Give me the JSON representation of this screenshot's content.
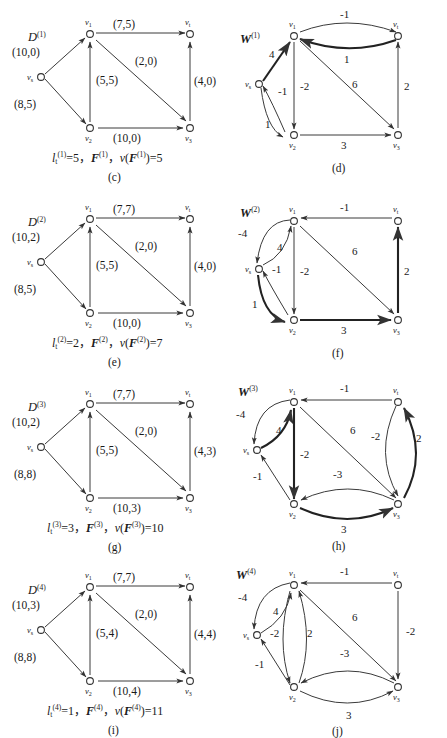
{
  "sheet": {
    "title": "Network flow iteration figures",
    "background": "#ffffff",
    "ink": "#1a1a1a",
    "accent_heavy": "#222222"
  },
  "vertex_names": {
    "s": "v",
    "s_sub": "s",
    "v1": "v",
    "v1_sub": "1",
    "v2": "v",
    "v2_sub": "2",
    "v3": "v",
    "v3_sub": "3",
    "t": "v",
    "t_sub": "t"
  },
  "rows": [
    {
      "id": "row-1",
      "flow_panel": {
        "graph_label_base": "D",
        "graph_label_sup": "(1)",
        "subcaption": "(c)",
        "caption_parts": {
          "l_base": "l",
          "l_sub": "t",
          "l_sup": "(1)",
          "l_value": "=5",
          "sep1": "，",
          "F_base": "F",
          "F_sup": "(1)",
          "sep2": "，",
          "v_base": "v(F",
          "v_sup": "(1)",
          "v_close": ")",
          "v_value": "=11"
        },
        "caption_text": "l t (1) =5， F (1) ， v(F (1) )=5",
        "edges": [
          {
            "name": "s-v1",
            "label": "(10,0)"
          },
          {
            "name": "s-v2",
            "label": "(8,5)"
          },
          {
            "name": "v1-t",
            "label": "(7,5)"
          },
          {
            "name": "v2-v1",
            "label": "(5,5)"
          },
          {
            "name": "v1-v3",
            "label": "(2,0)"
          },
          {
            "name": "v2-v3",
            "label": "(10,0)"
          },
          {
            "name": "v3-t",
            "label": "(4,0)"
          }
        ]
      },
      "residual_panel": {
        "graph_label_base": "W",
        "graph_label_sup": "(1)",
        "subcaption": "(d)",
        "edges": [
          {
            "name": "s-v1",
            "label": "4",
            "heavy": true
          },
          {
            "name": "s-v2",
            "label": "1",
            "heavy": false
          },
          {
            "name": "v2-s",
            "label": "-1",
            "heavy": false
          },
          {
            "name": "v1-t",
            "label": "-1",
            "heavy": false
          },
          {
            "name": "t-v1",
            "label": "1",
            "heavy": true
          },
          {
            "name": "v1-v2",
            "label": "-2",
            "heavy": false
          },
          {
            "name": "v1-v3",
            "label": "6",
            "heavy": false
          },
          {
            "name": "v2-v3",
            "label": "3",
            "heavy": false
          },
          {
            "name": "v3-t",
            "label": "2",
            "heavy": false
          }
        ]
      }
    },
    {
      "id": "row-2",
      "flow_panel": {
        "graph_label_base": "D",
        "graph_label_sup": "(2)",
        "subcaption": "(e)",
        "caption_text": "l t (2) =2， F (2) ， v(F (2) )=7",
        "edges": [
          {
            "name": "s-v1",
            "label": "(10,2)"
          },
          {
            "name": "s-v2",
            "label": "(8,5)"
          },
          {
            "name": "v1-t",
            "label": "(7,7)"
          },
          {
            "name": "v2-v1",
            "label": "(5,5)"
          },
          {
            "name": "v1-v3",
            "label": "(2,0)"
          },
          {
            "name": "v2-v3",
            "label": "(10,0)"
          },
          {
            "name": "v3-t",
            "label": "(4,0)"
          }
        ]
      },
      "residual_panel": {
        "graph_label_base": "W",
        "graph_label_sup": "(2)",
        "subcaption": "(f)",
        "edges": [
          {
            "name": "v1-s",
            "label": "-4",
            "heavy": false
          },
          {
            "name": "s-v1",
            "label": "4",
            "heavy": false
          },
          {
            "name": "v2-s",
            "label": "-1",
            "heavy": false
          },
          {
            "name": "s-v2",
            "label": "1",
            "heavy": true
          },
          {
            "name": "t-v1",
            "label": "-1",
            "heavy": false
          },
          {
            "name": "v1-v2",
            "label": "-2",
            "heavy": false
          },
          {
            "name": "v1-v3",
            "label": "6",
            "heavy": false
          },
          {
            "name": "v2-v3",
            "label": "3",
            "heavy": true
          },
          {
            "name": "v3-t",
            "label": "2",
            "heavy": true
          }
        ]
      }
    },
    {
      "id": "row-3",
      "flow_panel": {
        "graph_label_base": "D",
        "graph_label_sup": "(3)",
        "subcaption": "(g)",
        "caption_text": "l t (3) =3， F (3) ， v(F (3) )=10",
        "edges": [
          {
            "name": "s-v1",
            "label": "(10,2)"
          },
          {
            "name": "s-v2",
            "label": "(8,8)"
          },
          {
            "name": "v1-t",
            "label": "(7,7)"
          },
          {
            "name": "v2-v1",
            "label": "(5,5)"
          },
          {
            "name": "v1-v3",
            "label": "(2,0)"
          },
          {
            "name": "v2-v3",
            "label": "(10,3)"
          },
          {
            "name": "v3-t",
            "label": "(4,3)"
          }
        ]
      },
      "residual_panel": {
        "graph_label_base": "W",
        "graph_label_sup": "(3)",
        "subcaption": "(h)",
        "edges": [
          {
            "name": "v1-s",
            "label": "-4",
            "heavy": false
          },
          {
            "name": "s-v1",
            "label": "4",
            "heavy": true
          },
          {
            "name": "v2-s",
            "label": "-1",
            "heavy": false
          },
          {
            "name": "t-v1",
            "label": "-1",
            "heavy": false
          },
          {
            "name": "v1-v2",
            "label": "-2",
            "heavy": true
          },
          {
            "name": "v1-v3",
            "label": "6",
            "heavy": false
          },
          {
            "name": "t-v3",
            "label": "-2",
            "heavy": false
          },
          {
            "name": "v3-t",
            "label": "2",
            "heavy": true
          },
          {
            "name": "v3-v2",
            "label": "-3",
            "heavy": false
          },
          {
            "name": "v2-v3",
            "label": "3",
            "heavy": true
          }
        ]
      }
    },
    {
      "id": "row-4",
      "flow_panel": {
        "graph_label_base": "D",
        "graph_label_sup": "(4)",
        "subcaption": "(i)",
        "caption_text": "l t (4) =1， F (4) ， v(F (4) )=11",
        "edges": [
          {
            "name": "s-v1",
            "label": "(10,3)"
          },
          {
            "name": "s-v2",
            "label": "(8,8)"
          },
          {
            "name": "v1-t",
            "label": "(7,7)"
          },
          {
            "name": "v2-v1",
            "label": "(5,4)"
          },
          {
            "name": "v1-v3",
            "label": "(2,0)"
          },
          {
            "name": "v2-v3",
            "label": "(10,4)"
          },
          {
            "name": "v3-t",
            "label": "(4,4)"
          }
        ]
      },
      "residual_panel": {
        "graph_label_base": "W",
        "graph_label_sup": "(4)",
        "subcaption": "(j)",
        "edges": [
          {
            "name": "v1-s",
            "label": "-4",
            "heavy": false
          },
          {
            "name": "s-v1",
            "label": "4",
            "heavy": false
          },
          {
            "name": "v1-v2",
            "label": "-2",
            "heavy": false
          },
          {
            "name": "v2-v1",
            "label": "2",
            "heavy": false
          },
          {
            "name": "v2-s",
            "label": "-1",
            "heavy": false
          },
          {
            "name": "t-v1",
            "label": "-1",
            "heavy": false
          },
          {
            "name": "v1-v3",
            "label": "6",
            "heavy": false
          },
          {
            "name": "t-v3",
            "label": "-2",
            "heavy": false
          },
          {
            "name": "v3-v2",
            "label": "-3",
            "heavy": false
          },
          {
            "name": "v2-v3",
            "label": "3",
            "heavy": false
          }
        ]
      }
    }
  ],
  "captions": {
    "row1_flow": "l_t^(1)=5, F^(1), v(F^(1))=5",
    "row2_flow": "l_t^(2)=2, F^(2), v(F^(2))=7",
    "row3_flow": "l_t^(3)=3, F^(3), v(F^(3))=10",
    "row4_flow": "l_t^(4)=1, F^(4), v(F^(4))=11"
  },
  "caption_values": {
    "r1": {
      "l": "=5",
      "v": "=5"
    },
    "r2": {
      "l": "=2",
      "v": "=7"
    },
    "r3": {
      "l": "=3",
      "v": "=10"
    },
    "r4": {
      "l": "=1",
      "v": "=11"
    }
  },
  "sups": {
    "s1": "(1)",
    "s2": "(2)",
    "s3": "(3)",
    "s4": "(4)"
  }
}
